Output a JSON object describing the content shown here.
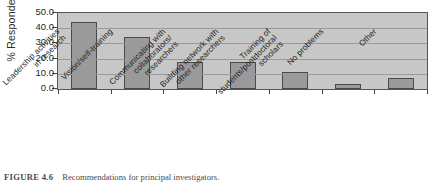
{
  "figure": {
    "caption_label": "FIGURE 4.6",
    "caption_text": "Recommendations for principal investigators."
  },
  "chart_data": {
    "type": "bar",
    "title": "",
    "xlabel": "",
    "ylabel": "% Respondents",
    "ylim": [
      0.0,
      50.0
    ],
    "ytick_step": 10.0,
    "ytick_labels": [
      "50.0",
      "40.0",
      "30.0",
      "20.0",
      "10.0",
      "0.0"
    ],
    "ytick_values": [
      50.0,
      40.0,
      30.0,
      20.0,
      10.0,
      0.0
    ],
    "grid": true,
    "legend": "none",
    "categories": [
      "Leadership activities\nin research",
      "Vision/self-training",
      "Communicating with\ncollaborators/\nresearchers",
      "Building network with\nother researchers",
      "Training of\nstudents/postdoctoral\nscholars",
      "No problems",
      "Other"
    ],
    "values": [
      44.0,
      34.0,
      18.0,
      18.0,
      11.5,
      3.0,
      7.0
    ],
    "bar_color": "#9a9a9a",
    "bar_edge_color": "#4a4a4a",
    "plot_background": "#c7c7c7"
  }
}
